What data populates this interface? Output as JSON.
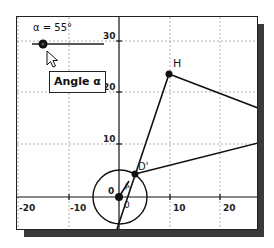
{
  "slider": {
    "label": "α = 55°",
    "variable": "α",
    "value_deg": 55,
    "tooltip": "Angle α"
  },
  "axes": {
    "x_ticks": [
      "-20",
      "-10",
      "0",
      "10",
      "20"
    ],
    "y_ticks": [
      "10",
      "20",
      "30"
    ],
    "origin_label": "0"
  },
  "points": {
    "H": {
      "label": "H",
      "x": 10,
      "y": 24
    },
    "D_prime": {
      "label": "D'",
      "x": 3,
      "y": 4.6
    },
    "O": {
      "label": "0",
      "x": 0,
      "y": 0
    }
  },
  "labels": {
    "segment_a": "A",
    "below_origin": "0"
  },
  "colors": {
    "stroke": "#111111",
    "grid": "#b0b0b0",
    "shadow": "#3a3a3a",
    "background": "#ffffff"
  }
}
